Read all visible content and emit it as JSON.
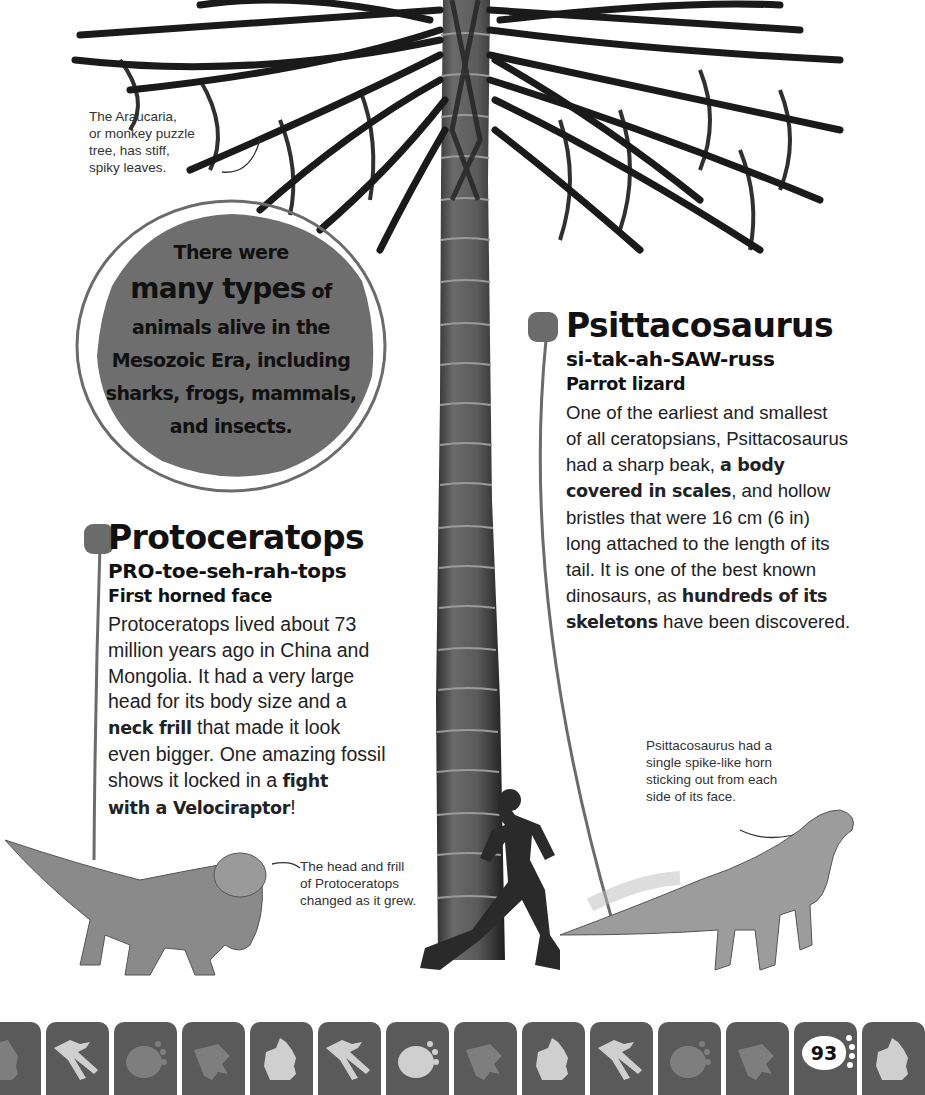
{
  "page": {
    "number": "93",
    "accent_color": "#6b6b6b"
  },
  "captions": {
    "araucaria": [
      "The Araucaria,",
      "or monkey puzzle",
      "tree, has stiff,",
      "spiky leaves."
    ],
    "protoceratops_head": [
      "The head and frill",
      "of Protoceratops",
      "changed as it grew."
    ],
    "psittacosaurus_horn": [
      "Psittacosaurus had a",
      "single spike-like horn",
      "sticking out from each",
      "side of its face."
    ]
  },
  "callout": {
    "line1": "There were",
    "line2_big": "many types",
    "line2_small": " of",
    "line3": "animals alive in the",
    "line4": "Mesozoic Era, including",
    "line5": "sharks, frogs, mammals,",
    "line6": "and insects."
  },
  "protoceratops": {
    "title": "Protoceratops",
    "pronunciation": "PRO-toe-seh-rah-tops",
    "meaning": "First horned face",
    "body": [
      {
        "t": "Protoceratops lived about 73",
        "b": false
      },
      {
        "t": "million years ago in China and",
        "b": false
      },
      {
        "t": "Mongolia. It had a very large",
        "b": false
      },
      {
        "t": "head for its body size and a",
        "b": false
      }
    ],
    "line5_bold": "neck frill",
    "line5_rest": " that made it look",
    "line6": "even bigger. One amazing fossil",
    "line7_pre": "shows it locked in a ",
    "line7_bold": "fight",
    "line8_bold": "with a Velociraptor",
    "line8_rest": "!"
  },
  "psittacosaurus": {
    "title": "Psittacosaurus",
    "pronunciation": "si-tak-ah-SAW-russ",
    "meaning": "Parrot lizard",
    "line1": "One of the earliest and smallest",
    "line2": "of all ceratopsians, Psittacosaurus",
    "line3_pre": "had a sharp beak, ",
    "line3_bold": "a body",
    "line4_bold": "covered in scales",
    "line4_rest": ", and hollow",
    "line5": "bristles that were 16 cm (6 in)",
    "line6": "long attached to the length of its",
    "line7": "tail. It is one of the best known",
    "line8_pre": "dinosaurs, as ",
    "line8_bold": "hundreds of its",
    "line9_bold": "skeletons",
    "line9_rest": " have been discovered."
  },
  "footer": {
    "tiles": [
      "hand-print",
      "bird-footprint",
      "round-footprint",
      "theropod-footprint",
      "hand-print",
      "bird-footprint",
      "round-footprint",
      "theropod-footprint",
      "hand-print",
      "bird-footprint",
      "round-footprint",
      "theropod-footprint",
      "page-number",
      "hand-print"
    ]
  }
}
